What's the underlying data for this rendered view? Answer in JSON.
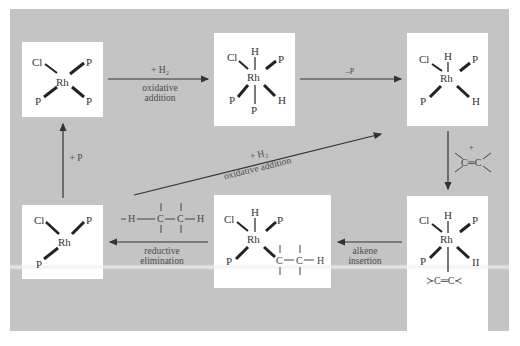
{
  "diagram": {
    "type": "catalytic-cycle",
    "colors": {
      "panel": "#c4c4c4",
      "box": "#ffffff",
      "arrow": "#333333",
      "text": "#4a4a4a"
    },
    "complexes": [
      {
        "id": "c1",
        "metal": "Rh",
        "ligands": [
          "Cl",
          "P",
          "P",
          "P"
        ],
        "geometry": "square-planar"
      },
      {
        "id": "c2",
        "metal": "Rh",
        "ligands": [
          "H",
          "Cl",
          "P",
          "P",
          "H",
          "P"
        ],
        "geometry": "octahedral"
      },
      {
        "id": "c3",
        "metal": "Rh",
        "ligands": [
          "H",
          "Cl",
          "P",
          "P",
          "H"
        ],
        "geometry": "square-pyramidal"
      },
      {
        "id": "c4",
        "metal": "Rh",
        "ligands": [
          "H",
          "Cl",
          "P",
          "P",
          "H",
          ">C=C<"
        ],
        "geometry": "octahedral"
      },
      {
        "id": "c5",
        "metal": "Rh",
        "ligands": [
          "H",
          "Cl",
          "P",
          "P",
          "C–C–H"
        ],
        "geometry": "square-pyramidal"
      },
      {
        "id": "c6",
        "metal": "Rh",
        "ligands": [
          "Cl",
          "P",
          "P"
        ],
        "geometry": "T-shaped"
      }
    ],
    "steps": [
      {
        "from": "c1",
        "to": "c2",
        "reagent": "+ H₂",
        "label": "oxidative",
        "label2": "addition"
      },
      {
        "from": "c2",
        "to": "c3",
        "reagent": "–P",
        "label": ""
      },
      {
        "from": "c3",
        "to": "c4",
        "reagent": "+",
        "alkene": "C═C",
        "label": ""
      },
      {
        "from": "c4",
        "to": "c5",
        "reagent": "",
        "label": "alkene",
        "label2": "insertion"
      },
      {
        "from": "c5",
        "to": "c6",
        "product": "– H — C — C — H",
        "label": "reductive",
        "label2": "elimination"
      },
      {
        "from": "c6",
        "to": "c1",
        "reagent": "+ P",
        "label": ""
      },
      {
        "from": "c6",
        "to": "c3",
        "reagent": "+ H₂",
        "label": "oxidative addition"
      }
    ],
    "text": {
      "cl": "Cl",
      "p": "P",
      "rh": "Rh",
      "h": "H",
      "c": "C",
      "h_alt": "II",
      "plus_h2": "+ H₂",
      "oxidative": "oxidative",
      "addition": "addition",
      "oxidative_addition": "oxidative addition",
      "minus_p": "–P",
      "plus": "+",
      "alkene": "C═C",
      "alkene_bound": "≻C═C≺",
      "plus_p": "+ P",
      "reductive": "reductive",
      "elimination": "elimination",
      "alkene_label": "alkene",
      "insertion": "insertion"
    }
  }
}
